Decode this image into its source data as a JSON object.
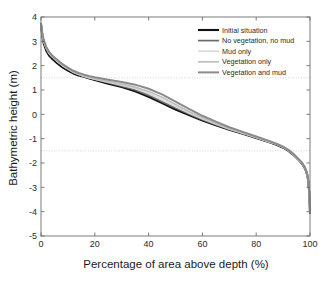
{
  "chart_data": {
    "type": "line",
    "title": "",
    "xlabel": "Percentage of area above depth (%)",
    "ylabel": "Bathymetric height (m)",
    "xlim": [
      0,
      100
    ],
    "ylim": [
      -5,
      4
    ],
    "xticks": [
      0,
      20,
      40,
      60,
      80,
      100
    ],
    "yticks": [
      -5,
      -4,
      -3,
      -2,
      -1,
      0,
      1,
      2,
      3,
      4
    ],
    "xtick_labels": [
      "0",
      "20",
      "40",
      "60",
      "80",
      "100"
    ],
    "ytick_labels": [
      "-5",
      "-4",
      "-3",
      "-2",
      "-1",
      "0",
      "1",
      "2",
      "3",
      "4"
    ],
    "grid": false,
    "legend_position": "upper right",
    "reference_lines": [
      {
        "axis": "y",
        "value": 1.5,
        "style": "dotted",
        "color": "#c9c9c9"
      },
      {
        "axis": "y",
        "value": -1.5,
        "style": "dotted",
        "color": "#c9c9c9"
      }
    ],
    "x": [
      0,
      0.5,
      1,
      2,
      3,
      4,
      5,
      6,
      8,
      10,
      12,
      14,
      16,
      18,
      20,
      25,
      30,
      35,
      40,
      45,
      50,
      55,
      60,
      65,
      70,
      75,
      80,
      85,
      88,
      90,
      92,
      94,
      96,
      97,
      98,
      98.6,
      99.1,
      99.4,
      99.7,
      99.9,
      100
    ],
    "series": [
      {
        "name": "Initial situation",
        "color": "#111111",
        "width": 2.1,
        "values": [
          3.7,
          3.2,
          2.92,
          2.6,
          2.42,
          2.3,
          2.2,
          2.1,
          1.93,
          1.8,
          1.68,
          1.6,
          1.54,
          1.47,
          1.41,
          1.26,
          1.12,
          0.95,
          0.72,
          0.46,
          0.2,
          -0.03,
          -0.25,
          -0.45,
          -0.63,
          -0.8,
          -0.97,
          -1.15,
          -1.27,
          -1.37,
          -1.5,
          -1.68,
          -1.9,
          -2.02,
          -2.2,
          -2.35,
          -2.55,
          -2.8,
          -3.2,
          -3.7,
          -4.05
        ]
      },
      {
        "name": "No vegetation, no mud",
        "color": "#6b6b6b",
        "width": 1.7,
        "values": [
          3.72,
          3.3,
          3.02,
          2.72,
          2.53,
          2.4,
          2.3,
          2.2,
          2.02,
          1.88,
          1.74,
          1.65,
          1.57,
          1.5,
          1.44,
          1.3,
          1.16,
          1.0,
          0.78,
          0.52,
          0.26,
          0.02,
          -0.22,
          -0.43,
          -0.62,
          -0.79,
          -0.96,
          -1.14,
          -1.26,
          -1.36,
          -1.49,
          -1.67,
          -1.89,
          -2.01,
          -2.19,
          -2.34,
          -2.54,
          -2.79,
          -3.19,
          -3.69,
          -4.04
        ]
      },
      {
        "name": "Mud only",
        "color": "#d8d8d8",
        "width": 1.7,
        "values": [
          3.71,
          3.28,
          3.0,
          2.7,
          2.5,
          2.38,
          2.28,
          2.18,
          2.0,
          1.86,
          1.73,
          1.64,
          1.56,
          1.5,
          1.44,
          1.32,
          1.2,
          1.06,
          0.86,
          0.6,
          0.32,
          0.06,
          -0.18,
          -0.4,
          -0.6,
          -0.78,
          -0.95,
          -1.13,
          -1.25,
          -1.35,
          -1.48,
          -1.66,
          -1.88,
          -2.0,
          -2.18,
          -2.33,
          -2.53,
          -2.78,
          -3.18,
          -3.68,
          -4.03
        ]
      },
      {
        "name": "Vegetation only",
        "color": "#bdbdbd",
        "width": 1.7,
        "values": [
          3.71,
          3.29,
          3.01,
          2.71,
          2.52,
          2.39,
          2.29,
          2.19,
          2.01,
          1.87,
          1.74,
          1.65,
          1.58,
          1.52,
          1.46,
          1.35,
          1.24,
          1.12,
          0.94,
          0.7,
          0.4,
          0.12,
          -0.14,
          -0.37,
          -0.58,
          -0.76,
          -0.94,
          -1.12,
          -1.24,
          -1.34,
          -1.47,
          -1.65,
          -1.87,
          -1.99,
          -2.17,
          -2.32,
          -2.52,
          -2.77,
          -3.17,
          -3.67,
          -4.02
        ]
      },
      {
        "name": "Vegetation and mud",
        "color": "#8a8a8a",
        "width": 2.0,
        "values": [
          3.73,
          3.33,
          3.06,
          2.76,
          2.57,
          2.44,
          2.34,
          2.24,
          2.06,
          1.92,
          1.79,
          1.7,
          1.63,
          1.57,
          1.52,
          1.42,
          1.33,
          1.22,
          1.05,
          0.82,
          0.52,
          0.22,
          -0.06,
          -0.3,
          -0.53,
          -0.72,
          -0.91,
          -1.1,
          -1.23,
          -1.33,
          -1.46,
          -1.64,
          -1.86,
          -1.98,
          -2.16,
          -2.31,
          -2.51,
          -2.76,
          -3.16,
          -3.66,
          -4.01
        ]
      }
    ]
  },
  "legend": {
    "entries": [
      {
        "label": "Initial situation"
      },
      {
        "label": "No vegetation, no mud"
      },
      {
        "label": "Mud only"
      },
      {
        "label": "Vegetation only"
      },
      {
        "label": "Vegetation and mud"
      }
    ]
  },
  "axes": {
    "x_title": "Percentage of area above depth (%)",
    "y_title": "Bathymetric height (m)"
  }
}
